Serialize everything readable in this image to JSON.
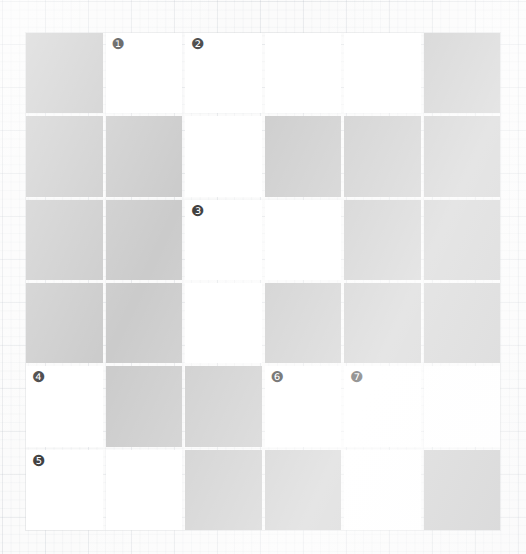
{
  "puzzle": {
    "type": "crossword-grid",
    "columns": 6,
    "rows": 6,
    "open_cell_color": "#ffffff",
    "block_cell_color": "#cbcbcb",
    "background_color": "#fbfbfb",
    "number_color": "#3a3a3a",
    "clue_numbers_present": [
      "❶",
      "❷",
      "❸",
      "❹",
      "❺",
      "❻",
      "❼"
    ],
    "cells": [
      [
        {
          "state": "block",
          "number": ""
        },
        {
          "state": "open",
          "number": "❶"
        },
        {
          "state": "open",
          "number": "❷"
        },
        {
          "state": "open",
          "number": ""
        },
        {
          "state": "open",
          "number": ""
        },
        {
          "state": "block",
          "number": ""
        }
      ],
      [
        {
          "state": "block",
          "number": ""
        },
        {
          "state": "block",
          "number": ""
        },
        {
          "state": "open",
          "number": ""
        },
        {
          "state": "block",
          "number": ""
        },
        {
          "state": "block",
          "number": ""
        },
        {
          "state": "block",
          "number": ""
        }
      ],
      [
        {
          "state": "block",
          "number": ""
        },
        {
          "state": "block",
          "number": ""
        },
        {
          "state": "open",
          "number": "❸"
        },
        {
          "state": "open",
          "number": ""
        },
        {
          "state": "block",
          "number": ""
        },
        {
          "state": "block",
          "number": ""
        }
      ],
      [
        {
          "state": "block",
          "number": ""
        },
        {
          "state": "block",
          "number": ""
        },
        {
          "state": "open",
          "number": ""
        },
        {
          "state": "block",
          "number": ""
        },
        {
          "state": "block",
          "number": ""
        },
        {
          "state": "block",
          "number": ""
        }
      ],
      [
        {
          "state": "open",
          "number": "❹"
        },
        {
          "state": "block",
          "number": ""
        },
        {
          "state": "block",
          "number": ""
        },
        {
          "state": "open",
          "number": "❻"
        },
        {
          "state": "open",
          "number": "❼"
        },
        {
          "state": "open",
          "number": ""
        }
      ],
      [
        {
          "state": "open",
          "number": "❺"
        },
        {
          "state": "open",
          "number": ""
        },
        {
          "state": "block",
          "number": ""
        },
        {
          "state": "block",
          "number": ""
        },
        {
          "state": "open",
          "number": ""
        },
        {
          "state": "block",
          "number": ""
        }
      ]
    ]
  }
}
